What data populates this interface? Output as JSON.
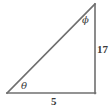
{
  "figure": {
    "kind": "right-triangle-diagram",
    "background_color": "#ffffff",
    "stroke_color": "#6f6f6f",
    "label_color": "#3b3b3b",
    "angles": {
      "theta": {
        "symbol": "θ",
        "name": "theta",
        "position": "bottom-left-vertex"
      },
      "phi": {
        "symbol": "ϕ",
        "name": "phi",
        "position": "top-right-vertex"
      }
    },
    "sides": {
      "base": {
        "label": "5",
        "position": "bottom",
        "name": "adjacent-to-theta"
      },
      "vertical": {
        "label": "17",
        "position": "right",
        "name": "opposite-to-theta"
      },
      "hypotenuse": {
        "label": "",
        "position": "diagonal",
        "name": "hypotenuse"
      }
    },
    "vertices": {
      "bottom_left": [
        7,
        93
      ],
      "bottom_right": [
        95,
        93
      ],
      "top_right": [
        95,
        4
      ]
    },
    "right_angle_at": "bottom-right"
  }
}
